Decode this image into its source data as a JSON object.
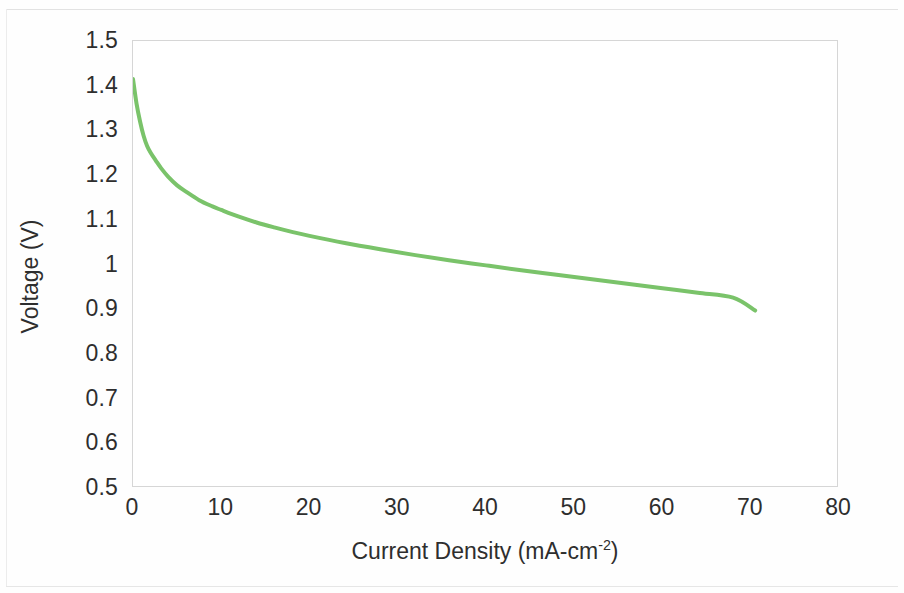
{
  "figure": {
    "background_color": "#ffffff",
    "plot_border_color": "#d6d6d6",
    "series_color": "#7ac36a"
  },
  "chart_data": {
    "type": "line",
    "title": "",
    "subtitle": "",
    "xlabel": "Current Density (mA-cm",
    "xlabel_superscript": "-2",
    "xlabel_suffix": ")",
    "xlabel_full": "Current Density (mA-cm-2)",
    "ylabel": "Voltage (V)",
    "xlim": [
      0,
      80
    ],
    "ylim": [
      0.5,
      1.5
    ],
    "xticks": [
      "0",
      "10",
      "20",
      "30",
      "40",
      "50",
      "60",
      "70",
      "80"
    ],
    "xtick_values": [
      0,
      10,
      20,
      30,
      40,
      50,
      60,
      70,
      80
    ],
    "yticks": [
      "0.5",
      "0.6",
      "0.7",
      "0.8",
      "0.9",
      "1",
      "1.1",
      "1.2",
      "1.3",
      "1.4",
      "1.5"
    ],
    "ytick_values": [
      0.5,
      0.6,
      0.7,
      0.8,
      0.9,
      1.0,
      1.1,
      1.2,
      1.3,
      1.4,
      1.5
    ],
    "grid": false,
    "legend": null,
    "legend_position": "none",
    "series": [
      {
        "name": "Polarization curve",
        "color": "#7ac36a",
        "line_width": 4,
        "x": [
          0.0,
          0.4,
          0.8,
          1.2,
          1.6,
          2.0,
          2.6,
          3.2,
          4.0,
          5.0,
          6.0,
          7.5,
          9.0,
          10.0,
          12.0,
          14.0,
          16.0,
          18.0,
          20.0,
          24.0,
          28.0,
          32.0,
          36.0,
          40.0,
          44.0,
          48.0,
          52.0,
          56.0,
          60.0,
          64.0,
          68.0,
          70.5
        ],
        "y": [
          1.415,
          1.36,
          1.32,
          1.288,
          1.265,
          1.25,
          1.232,
          1.215,
          1.196,
          1.177,
          1.163,
          1.144,
          1.13,
          1.122,
          1.107,
          1.094,
          1.083,
          1.073,
          1.064,
          1.048,
          1.034,
          1.021,
          1.009,
          0.998,
          0.987,
          0.977,
          0.967,
          0.957,
          0.947,
          0.937,
          0.926,
          0.897
        ]
      }
    ]
  }
}
